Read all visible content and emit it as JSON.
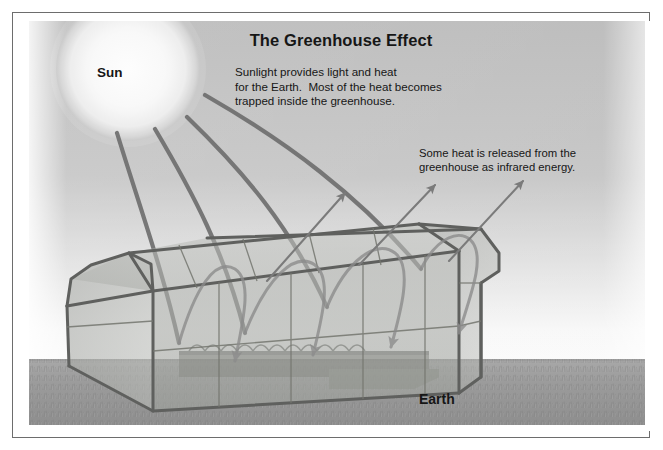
{
  "figure": {
    "title": "The Greenhouse Effect",
    "frame_border_color": "#6d6d6d"
  },
  "labels": {
    "sun": "Sun",
    "earth": "Earth"
  },
  "annotations": {
    "sunlight_note": "Sunlight provides light and heat\nfor the Earth.  Most of the heat becomes\ntrapped inside the greenhouse.",
    "infrared_note": "Some heat is released from the\ngreenhouse as infrared energy."
  },
  "colors": {
    "sky_top": "#b9b9b9",
    "sky_horizon": "#f4f4f4",
    "ground_near": "#8f8f8f",
    "ground_far": "#a3a3a3",
    "sun_core": "#fcfcfc",
    "sun_edge": "#c8c8c8",
    "ray_incoming": "#6f6f6f",
    "ray_outgoing": "#8a8a8a",
    "glass_fill": "#a8aaa6",
    "frame_bar": "#5f605e",
    "text": "#161616"
  },
  "scene_elements": [
    {
      "name": "sun",
      "type": "radial-glow-circle",
      "cx": 99,
      "cy": 48,
      "r": 72
    },
    {
      "name": "incoming-sunlight-rays",
      "count": 4,
      "style": "thick curved arcs from sun into greenhouse"
    },
    {
      "name": "trapped-heat-loops",
      "count": 4,
      "style": "wavy bounced rays inside greenhouse with down arrows"
    },
    {
      "name": "outgoing-infrared-arrows",
      "count": 3,
      "style": "thin straight arrows angled up-right through roof"
    },
    {
      "name": "greenhouse",
      "type": "barn-roof glasshouse",
      "facing": "left-front three-quarter view"
    },
    {
      "name": "horizon-line",
      "y": 340
    },
    {
      "name": "grass-foreground",
      "type": "textured ground"
    }
  ]
}
